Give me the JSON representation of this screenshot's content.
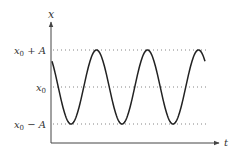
{
  "chart_data": {
    "type": "line",
    "title": "",
    "xlabel": "t",
    "ylabel": "x",
    "reference_lines": [
      {
        "label": "x0 + A",
        "value": 1,
        "style": "dotted"
      },
      {
        "label": "x0",
        "value": 0,
        "style": "dotted"
      },
      {
        "label": "x0 − A",
        "value": -1,
        "style": "dotted"
      }
    ],
    "y_tick_labels": [
      "x0 + A",
      "x0",
      "x0 − A"
    ],
    "series": [
      {
        "name": "x(t)",
        "color": "#222222",
        "periods_shown": 3.05,
        "start_value": 0.72,
        "start_direction": "decreasing",
        "minima_count": 3,
        "maxima_count": 3,
        "end_value": 0.72
      }
    ],
    "grid": false,
    "legend": null,
    "ylim": [
      -1.6,
      1.8
    ]
  },
  "labels": {
    "y_axis": "x",
    "x_axis": "t",
    "upper": {
      "base": "x",
      "sub": "0",
      "rest": " + A"
    },
    "mid": {
      "base": "x",
      "sub": "0",
      "rest": ""
    },
    "lower": {
      "base": "x",
      "sub": "0",
      "rest": " − A"
    }
  },
  "colors": {
    "curve": "#222222",
    "axis": "#444444",
    "dotted": "#777777",
    "text": "#333333"
  }
}
